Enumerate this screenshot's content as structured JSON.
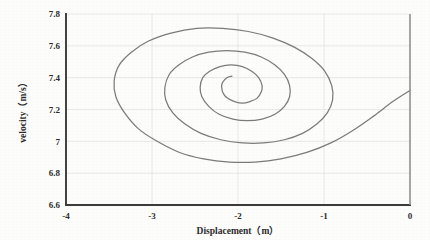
{
  "chart_data": {
    "type": "line",
    "title": "",
    "xlabel": "Displacement（m）",
    "ylabel": "velocity（m/s）",
    "xlim": [
      -4,
      0
    ],
    "ylim": [
      6.6,
      7.8
    ],
    "xticks": [
      "-4",
      "-3",
      "-2",
      "-1",
      "0"
    ],
    "xtick_values": [
      -4,
      -3,
      -2,
      -1,
      0
    ],
    "yticks": [
      "7.8",
      "7.6",
      "7.4",
      "7.2",
      "7",
      "6.8",
      "6.6"
    ],
    "ytick_values": [
      7.8,
      7.6,
      7.4,
      7.2,
      7.0,
      6.8,
      6.6
    ],
    "grid": true,
    "legend": "none",
    "line_color": "#7b7b7b",
    "axis_color": "#3b3b3b",
    "grid_color": "#e3e3e0",
    "series": [
      {
        "name": "phase trajectory",
        "description": "inward spiral converging to equilibrium",
        "equilibrium": [
          -1.88,
          7.285
        ],
        "turns": 3.6,
        "points": [
          [
            0.0,
            7.32
          ],
          [
            -0.2,
            7.25
          ],
          [
            -0.42,
            7.16
          ],
          [
            -0.66,
            7.07
          ],
          [
            -0.92,
            6.99
          ],
          [
            -1.2,
            6.93
          ],
          [
            -1.5,
            6.89
          ],
          [
            -1.8,
            6.87
          ],
          [
            -2.1,
            6.87
          ],
          [
            -2.4,
            6.89
          ],
          [
            -2.68,
            6.93
          ],
          [
            -2.94,
            7.0
          ],
          [
            -3.16,
            7.08
          ],
          [
            -3.32,
            7.18
          ],
          [
            -3.42,
            7.28
          ],
          [
            -3.44,
            7.38
          ],
          [
            -3.38,
            7.48
          ],
          [
            -3.24,
            7.56
          ],
          [
            -3.04,
            7.63
          ],
          [
            -2.78,
            7.68
          ],
          [
            -2.48,
            7.71
          ],
          [
            -2.18,
            7.71
          ],
          [
            -1.88,
            7.69
          ],
          [
            -1.6,
            7.65
          ],
          [
            -1.34,
            7.59
          ],
          [
            -1.14,
            7.52
          ],
          [
            -0.99,
            7.44
          ],
          [
            -0.91,
            7.35
          ],
          [
            -0.9,
            7.26
          ],
          [
            -0.96,
            7.18
          ],
          [
            -1.08,
            7.11
          ],
          [
            -1.25,
            7.05
          ],
          [
            -1.46,
            7.01
          ],
          [
            -1.7,
            6.99
          ],
          [
            -1.95,
            6.99
          ],
          [
            -2.2,
            7.01
          ],
          [
            -2.43,
            7.05
          ],
          [
            -2.62,
            7.11
          ],
          [
            -2.76,
            7.18
          ],
          [
            -2.84,
            7.26
          ],
          [
            -2.85,
            7.34
          ],
          [
            -2.8,
            7.42
          ],
          [
            -2.69,
            7.48
          ],
          [
            -2.53,
            7.53
          ],
          [
            -2.34,
            7.56
          ],
          [
            -2.13,
            7.57
          ],
          [
            -1.92,
            7.56
          ],
          [
            -1.73,
            7.53
          ],
          [
            -1.57,
            7.48
          ],
          [
            -1.46,
            7.42
          ],
          [
            -1.4,
            7.35
          ],
          [
            -1.4,
            7.28
          ],
          [
            -1.46,
            7.22
          ],
          [
            -1.57,
            7.17
          ],
          [
            -1.72,
            7.14
          ],
          [
            -1.89,
            7.13
          ],
          [
            -2.06,
            7.14
          ],
          [
            -2.22,
            7.17
          ],
          [
            -2.34,
            7.22
          ],
          [
            -2.42,
            7.28
          ],
          [
            -2.44,
            7.34
          ],
          [
            -2.41,
            7.4
          ],
          [
            -2.33,
            7.44
          ],
          [
            -2.21,
            7.47
          ],
          [
            -2.08,
            7.48
          ],
          [
            -1.95,
            7.47
          ],
          [
            -1.84,
            7.44
          ],
          [
            -1.76,
            7.4
          ],
          [
            -1.72,
            7.35
          ],
          [
            -1.73,
            7.31
          ],
          [
            -1.78,
            7.27
          ],
          [
            -1.86,
            7.25
          ],
          [
            -1.95,
            7.24
          ],
          [
            -2.04,
            7.25
          ],
          [
            -2.12,
            7.27
          ],
          [
            -2.17,
            7.3
          ],
          [
            -2.19,
            7.34
          ],
          [
            -2.18,
            7.37
          ],
          [
            -2.13,
            7.4
          ],
          [
            -2.07,
            7.41
          ]
        ]
      }
    ]
  }
}
